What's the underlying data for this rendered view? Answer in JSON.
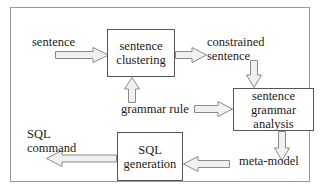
{
  "diagram": {
    "frame": {
      "border_color": "#999999",
      "background": "#ffffff"
    },
    "boxes": [
      {
        "id": "sentence-clustering",
        "lines": [
          "sentence",
          "clustering"
        ],
        "line1": "sentence",
        "line2": "clustering",
        "border_color": "#555555"
      },
      {
        "id": "sentence-grammar-analysis",
        "lines": [
          "sentence",
          "grammar",
          "analysis"
        ],
        "line1": "sentence",
        "line2": "grammar",
        "line3": "analysis",
        "border_color": "#555555"
      },
      {
        "id": "sql-generation",
        "lines": [
          "SQL",
          "generation"
        ],
        "line1": "SQL",
        "line2": "generation",
        "border_color": "#555555"
      }
    ],
    "labels": {
      "input_sentence": "sentence",
      "constrained_sentence_line1": "constrained",
      "constrained_sentence_line2": "sentence",
      "grammar_rule": "grammar rule",
      "sql_command_line1": "SQL",
      "sql_command_line2": "command",
      "meta_model": "meta-model"
    },
    "arrows": [
      {
        "id": "sentence-into-clustering",
        "direction": "right"
      },
      {
        "id": "grammar-rule-into-clustering",
        "direction": "up"
      },
      {
        "id": "clustering-to-constrained",
        "direction": "right"
      },
      {
        "id": "constrained-into-grammar-analysis",
        "direction": "down"
      },
      {
        "id": "grammar-rule-into-analysis",
        "direction": "right"
      },
      {
        "id": "analysis-to-meta-model",
        "direction": "down"
      },
      {
        "id": "meta-model-into-sql-generation",
        "direction": "left"
      },
      {
        "id": "sql-generation-to-command",
        "direction": "left"
      }
    ],
    "arrow_style": {
      "fill": "#f0f0f0",
      "stroke": "#8a8a8a"
    }
  }
}
